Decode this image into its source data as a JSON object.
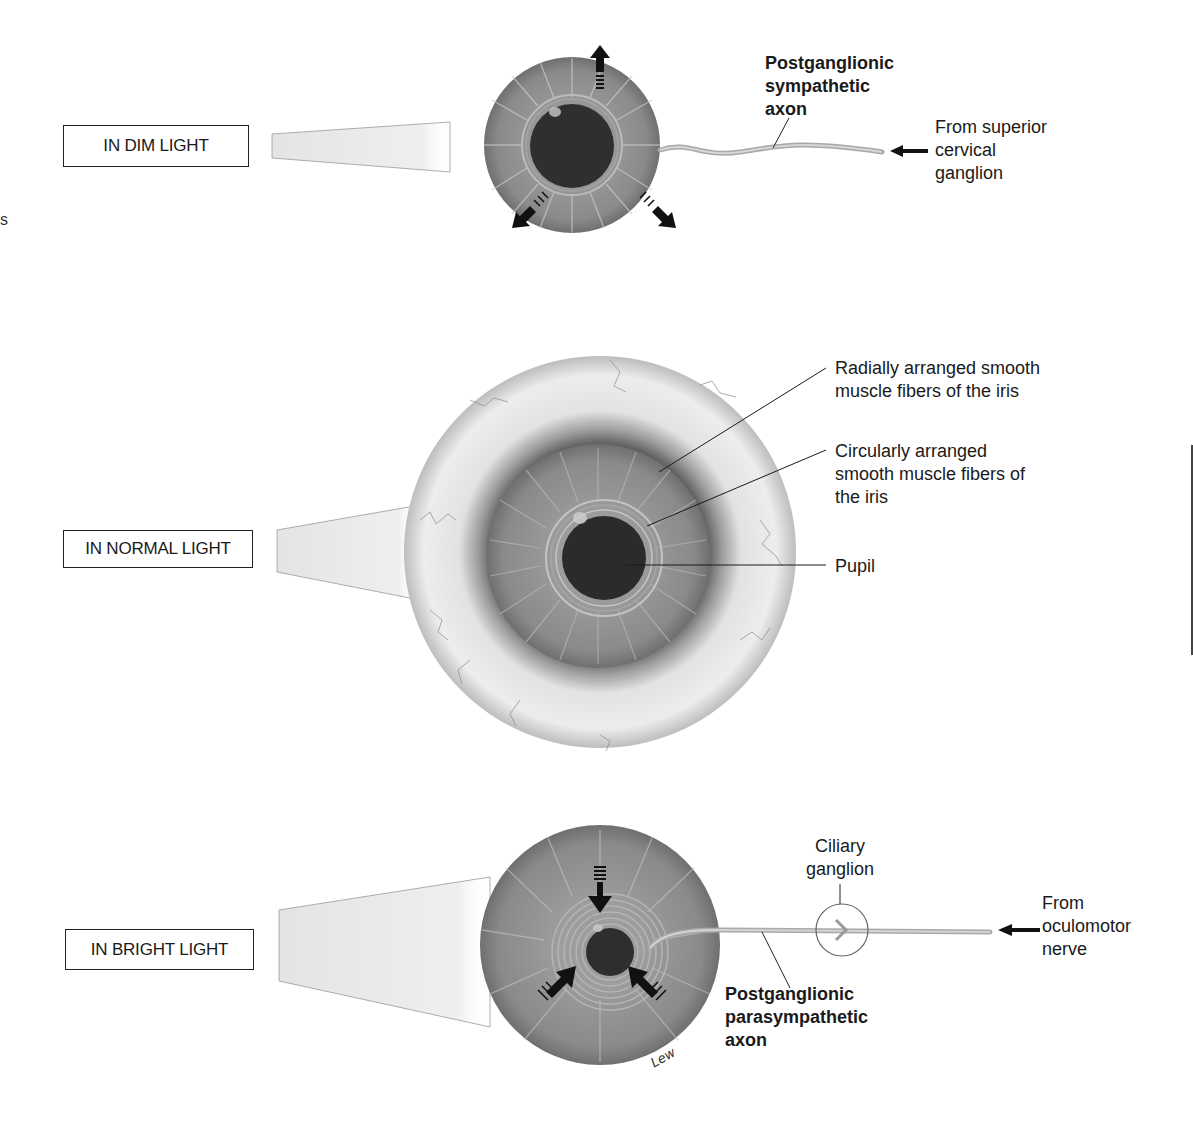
{
  "figure": {
    "panels": [
      {
        "id": "dim",
        "condition_label": "IN DIM LIGHT",
        "innervation_label": "Postganglionic sympathetic axon",
        "innervation_lines": [
          "Postganglionic",
          "sympathetic",
          "axon"
        ],
        "source_label_lines": [
          "From superior",
          "cervical",
          "ganglion"
        ],
        "arrow_direction": "outward",
        "pupil_state": "dilated"
      },
      {
        "id": "normal",
        "condition_label": "IN NORMAL LIGHT",
        "callouts": [
          {
            "lines": [
              "Radially arranged smooth",
              "muscle fibers of the iris"
            ]
          },
          {
            "lines": [
              "Circularly arranged",
              "smooth muscle fibers of",
              "the iris"
            ]
          },
          {
            "lines": [
              "Pupil"
            ]
          }
        ],
        "pupil_state": "normal"
      },
      {
        "id": "bright",
        "condition_label": "IN BRIGHT LIGHT",
        "ganglion_label_lines": [
          "Ciliary",
          "ganglion"
        ],
        "innervation_lines": [
          "Postganglionic",
          "parasympathetic",
          "axon"
        ],
        "source_label_lines": [
          "From",
          "oculomotor",
          "nerve"
        ],
        "arrow_direction": "inward",
        "pupil_state": "constricted",
        "signature": "Lew"
      }
    ],
    "edge_glyph": "s",
    "colors": {
      "iris": "#8a8a8a",
      "pupil": "#2b2b2b",
      "sclera": "#e8e8e8",
      "nerve": "#b9b9b9",
      "text": "#1a1a1a"
    }
  }
}
